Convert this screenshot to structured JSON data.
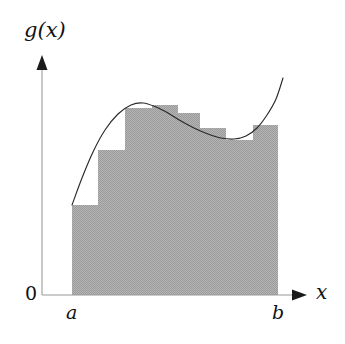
{
  "figure": {
    "background_color": "#ffffff",
    "axis_color": "#9a9a9a",
    "arrow_color": "#1a1a1a",
    "curve_color": "#2a2a2a",
    "fill_color": "#a8a8a8",
    "labels": {
      "y_axis": "g(x)",
      "x_axis": "x",
      "origin": "0",
      "lower_limit": "a",
      "upper_limit": "b"
    }
  },
  "chart_data": {
    "type": "area",
    "title": "",
    "subtitle": "",
    "xlabel": "x",
    "ylabel": "g(x)",
    "grid": false,
    "legend": null,
    "annotations": [
      {
        "text": "g(x)",
        "role": "y-axis-label",
        "x": 42,
        "y": 34
      },
      {
        "text": "0",
        "role": "origin-label",
        "x": 32,
        "y": 293
      },
      {
        "text": "a",
        "role": "x-tick-label",
        "x": 72,
        "y": 312
      },
      {
        "text": "b",
        "role": "x-tick-label",
        "x": 278,
        "y": 312
      },
      {
        "text": "x",
        "role": "x-axis-label",
        "x": 322,
        "y": 292
      }
    ],
    "axes": {
      "origin_px": {
        "x": 42,
        "y": 295
      },
      "x_axis_end_px": {
        "x": 307,
        "y": 295
      },
      "y_axis_end_px": {
        "x": 42,
        "y": 55
      },
      "baseline_y_px": 295,
      "interval_start_px": 72,
      "interval_end_px": 278,
      "x_arrow": true,
      "y_arrow": true
    },
    "interval": {
      "start_label": "a",
      "end_label": "b"
    },
    "series": [
      {
        "name": "g(x)",
        "type": "curve",
        "points": [
          {
            "x": 72,
            "y": 205
          },
          {
            "x": 82,
            "y": 178
          },
          {
            "x": 93,
            "y": 152
          },
          {
            "x": 105,
            "y": 130
          },
          {
            "x": 118,
            "y": 114
          },
          {
            "x": 131,
            "y": 105
          },
          {
            "x": 143,
            "y": 103
          },
          {
            "x": 156,
            "y": 107
          },
          {
            "x": 168,
            "y": 113
          },
          {
            "x": 181,
            "y": 121
          },
          {
            "x": 194,
            "y": 128
          },
          {
            "x": 208,
            "y": 134
          },
          {
            "x": 221,
            "y": 138
          },
          {
            "x": 234,
            "y": 139
          },
          {
            "x": 246,
            "y": 136
          },
          {
            "x": 257,
            "y": 128
          },
          {
            "x": 267,
            "y": 115
          },
          {
            "x": 276,
            "y": 99
          },
          {
            "x": 283,
            "y": 78
          }
        ]
      },
      {
        "name": "inscribed rectangles",
        "type": "step-rectangles",
        "rectangles": [
          {
            "x0": 72,
            "x1": 98,
            "top": 205
          },
          {
            "x0": 98,
            "x1": 125,
            "top": 150
          },
          {
            "x0": 125,
            "x1": 152,
            "top": 108
          },
          {
            "x0": 152,
            "x1": 178,
            "top": 105
          },
          {
            "x0": 178,
            "x1": 200,
            "top": 113
          },
          {
            "x0": 200,
            "x1": 226,
            "top": 128
          },
          {
            "x0": 226,
            "x1": 253,
            "top": 140
          },
          {
            "x0": 253,
            "x1": 278,
            "top": 125
          }
        ],
        "baseline": 295
      }
    ]
  }
}
